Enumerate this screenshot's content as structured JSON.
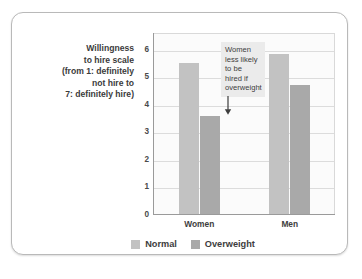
{
  "axis_title": "Willingness to hire scale (from 1: definitely not hire to 7: definitely hire)",
  "axis_title_lines": [
    "Willingness",
    "to hire scale",
    "(from 1: definitely",
    "not hire to",
    "7: definitely hire)"
  ],
  "annotation": {
    "text": "Women less likely to be hired if overweight",
    "lines": [
      "Women",
      "less likely",
      "to be",
      "hired if",
      "overweight"
    ],
    "arrow_icon": "down-arrow-icon"
  },
  "colors": {
    "normal": "#c2c2c2",
    "overweight": "#a9a9a9",
    "plot_background": "#fbfbfb",
    "gridline": "#dcdcdc",
    "axis": "#9a9a9a",
    "card_border": "#b9b9b9",
    "annotation_background": "#ebebeb",
    "text": "#3d3d3d"
  },
  "chart_data": {
    "type": "bar",
    "title": "",
    "xlabel": "",
    "ylabel": "Willingness to hire scale (from 1: definitely not hire to 7: definitely hire)",
    "categories": [
      "Women",
      "Men"
    ],
    "series": [
      {
        "name": "Normal",
        "values": [
          5.5,
          5.85
        ]
      },
      {
        "name": "Overweight",
        "values": [
          3.6,
          4.7
        ]
      }
    ],
    "ylim": [
      0,
      6.6
    ],
    "yticks": [
      0,
      1,
      2,
      3,
      4,
      5,
      6
    ],
    "ytick_labels": [
      "0",
      "1",
      "2",
      "3",
      "4",
      "5",
      "6"
    ],
    "grid": true,
    "legend_position": "bottom",
    "annotations": [
      {
        "text": "Women less likely to be hired if overweight",
        "points_to": {
          "category": "Women",
          "series": "Overweight"
        }
      }
    ]
  }
}
